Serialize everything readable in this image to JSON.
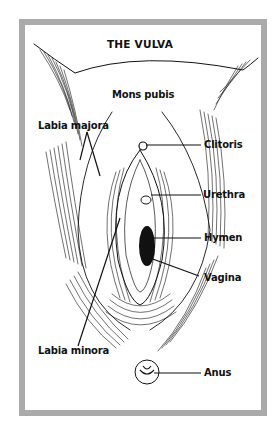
{
  "title": "THE VULVA",
  "labels": {
    "mons_pubis": "Mons pubis",
    "labia_majora": "Labia majora",
    "clitoris": "Clitoris",
    "urethra": "Urethra",
    "hymen": "Hymen",
    "vagina": "Vagina",
    "labia_minora": "Labia minora",
    "anus": "Anus"
  },
  "colors": {
    "frame": "#aaaaaa",
    "ink": "#111111",
    "background": "#ffffff"
  }
}
